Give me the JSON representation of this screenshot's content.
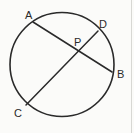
{
  "figure": {
    "kind": "geometry-diagram",
    "background_color": "#fbfbf9",
    "stroke_color": "#2a2a2a",
    "label_color": "#2a2a2a",
    "circle": {
      "center_x": 62,
      "center_y": 64.5,
      "radius": 52,
      "stroke_width": 1.6
    },
    "chords": [
      {
        "name": "chord-AB",
        "from": "A",
        "to": "B",
        "x1": 33,
        "y1": 22,
        "x2": 112,
        "y2": 72,
        "stroke_width": 1.5
      },
      {
        "name": "chord-CD",
        "from": "C",
        "to": "D",
        "x1": 26,
        "y1": 105,
        "x2": 98,
        "y2": 31,
        "stroke_width": 1.5
      }
    ],
    "points": [
      {
        "id": "A",
        "label": "A",
        "on": "circle",
        "cx": 33,
        "cy": 22,
        "label_x": 25,
        "label_y": 10
      },
      {
        "id": "D",
        "label": "D",
        "on": "circle",
        "cx": 98,
        "cy": 31,
        "label_x": 99,
        "label_y": 19
      },
      {
        "id": "P",
        "label": "P",
        "on": "intersection",
        "cx": 77,
        "cy": 49,
        "label_x": 74,
        "label_y": 37
      },
      {
        "id": "B",
        "label": "B",
        "on": "circle",
        "cx": 112,
        "cy": 72,
        "label_x": 117,
        "label_y": 69
      },
      {
        "id": "C",
        "label": "C",
        "on": "circle",
        "cx": 26,
        "cy": 105,
        "label_x": 14,
        "label_y": 108
      }
    ]
  }
}
